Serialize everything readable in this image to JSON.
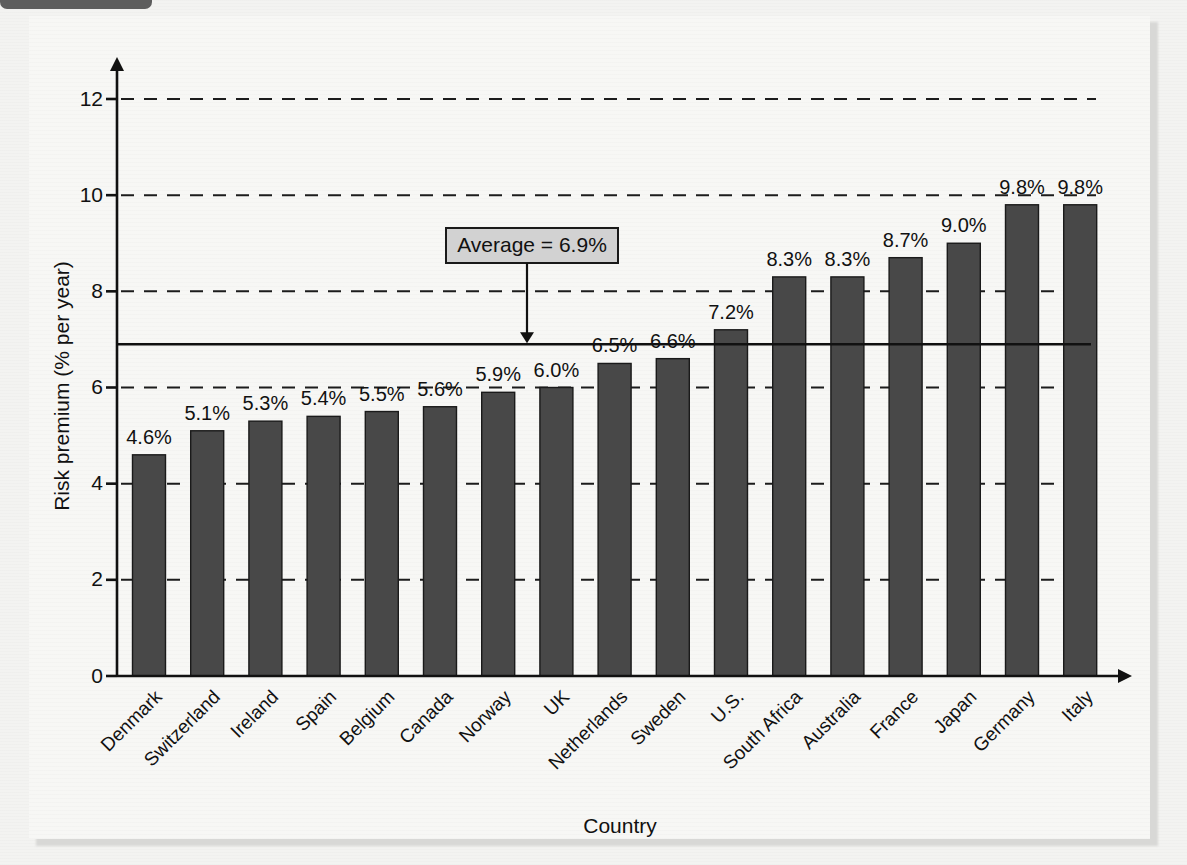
{
  "figure": {
    "panel_background": "#f7f7f5",
    "page_background": "#f3f3f1"
  },
  "chart_data": {
    "type": "bar",
    "title": "",
    "xlabel": "Country",
    "ylabel": "Risk premium (% per year)",
    "categories": [
      "Denmark",
      "Switzerland",
      "Ireland",
      "Spain",
      "Belgium",
      "Canada",
      "Norway",
      "UK",
      "Netherlands",
      "Sweden",
      "U.S.",
      "South Africa",
      "Australia",
      "France",
      "Japan",
      "Germany",
      "Italy"
    ],
    "values": [
      4.6,
      5.1,
      5.3,
      5.4,
      5.5,
      5.6,
      5.9,
      6.0,
      6.5,
      6.6,
      7.2,
      8.3,
      8.3,
      8.7,
      9.0,
      9.8,
      9.8
    ],
    "data_labels": [
      "4.6%",
      "5.1%",
      "5.3%",
      "5.4%",
      "5.5%",
      "5.6%",
      "5.9%",
      "6.0%",
      "6.5%",
      "6.6%",
      "7.2%",
      "8.3%",
      "8.3%",
      "8.7%",
      "9.0%",
      "9.8%",
      "9.8%"
    ],
    "ylim": [
      0,
      12
    ],
    "yticks": [
      0,
      2,
      4,
      6,
      8,
      10,
      12
    ],
    "ytick_labels": [
      "0",
      "2",
      "4",
      "6",
      "8",
      "10",
      "12"
    ],
    "grid": true,
    "grid_axis": "y",
    "grid_style": "dashed",
    "legend": "none",
    "bar_color": "#484848",
    "bar_edge_color": "#1a1a1a",
    "annotations": [
      {
        "name": "average-callout",
        "text": "Average = 6.9%",
        "value": 6.9,
        "type": "hline-with-arrow-label",
        "box_fill": "#d2d2d2",
        "line_color": "#111111"
      }
    ]
  }
}
